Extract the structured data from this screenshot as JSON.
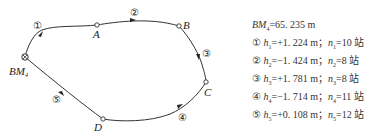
{
  "diagram": {
    "type": "closed leveling route",
    "start_point": "BM4",
    "points": [
      {
        "id": "BM4",
        "label": "BM",
        "sub": "4",
        "marker": "benchmark"
      },
      {
        "id": "A",
        "label": "A",
        "marker": "circle"
      },
      {
        "id": "B",
        "label": "B",
        "marker": "circle"
      },
      {
        "id": "C",
        "label": "C",
        "marker": "circle"
      },
      {
        "id": "D",
        "label": "D",
        "marker": "circle"
      }
    ],
    "segments": [
      {
        "num": "①",
        "from": "BM4",
        "to": "A"
      },
      {
        "num": "②",
        "from": "A",
        "to": "B"
      },
      {
        "num": "③",
        "from": "B",
        "to": "C"
      },
      {
        "num": "④",
        "from": "C",
        "to": "D"
      },
      {
        "num": "⑤",
        "from": "D",
        "to": "BM4"
      }
    ]
  },
  "legend": {
    "benchmark": {
      "name": "BM",
      "sub": "4",
      "value": "=65. 235 m"
    },
    "rows": [
      {
        "num": "①",
        "h": "h",
        "hsub": "1",
        "hval": "=+1. 224 m；",
        "n": "n",
        "nsub": "1",
        "nval": "=10 站"
      },
      {
        "num": "②",
        "h": "h",
        "hsub": "2",
        "hval": "=−1. 424 m；",
        "n": "n",
        "nsub": "2",
        "nval": "=8 站"
      },
      {
        "num": "③",
        "h": "h",
        "hsub": "3",
        "hval": "=+1. 781 m；",
        "n": "n",
        "nsub": "3",
        "nval": "=8 站"
      },
      {
        "num": "④",
        "h": "h",
        "hsub": "4",
        "hval": "=−1. 714 m；",
        "n": "n",
        "nsub": "4",
        "nval": "=11 站"
      },
      {
        "num": "⑤",
        "h": "h",
        "hsub": "5",
        "hval": "=+0. 108 m；",
        "n": "n",
        "nsub": "5",
        "nval": "=12 站"
      }
    ]
  }
}
